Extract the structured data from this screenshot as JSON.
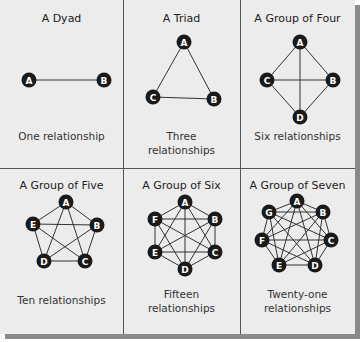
{
  "colors": {
    "background": "#ececec",
    "node_fill": "#1a1a1a",
    "node_text": "#ffffff",
    "edge": "#333333",
    "divider": "#555555",
    "shadow": "#8a8a8a"
  },
  "panels": [
    {
      "title": "A Dyad",
      "caption_lines": [
        "One relationship"
      ],
      "nodes": [
        "A",
        "B"
      ],
      "edge_count": 1
    },
    {
      "title": "A Triad",
      "caption_lines": [
        "Three",
        "relationships"
      ],
      "nodes": [
        "A",
        "B",
        "C"
      ],
      "edge_count": 3
    },
    {
      "title": "A Group of Four",
      "caption_lines": [
        "Six relationships"
      ],
      "nodes": [
        "A",
        "B",
        "C",
        "D"
      ],
      "edge_count": 6
    },
    {
      "title": "A Group of Five",
      "caption_lines": [
        "Ten relationships"
      ],
      "nodes": [
        "A",
        "B",
        "C",
        "D",
        "E"
      ],
      "edge_count": 10
    },
    {
      "title": "A Group of Six",
      "caption_lines": [
        "Fifteen",
        "relationships"
      ],
      "nodes": [
        "A",
        "B",
        "C",
        "D",
        "E",
        "F"
      ],
      "edge_count": 15
    },
    {
      "title": "A Group of Seven",
      "caption_lines": [
        "Twenty-one",
        "relationships"
      ],
      "nodes": [
        "A",
        "B",
        "C",
        "D",
        "E",
        "F",
        "G"
      ],
      "edge_count": 21
    }
  ]
}
